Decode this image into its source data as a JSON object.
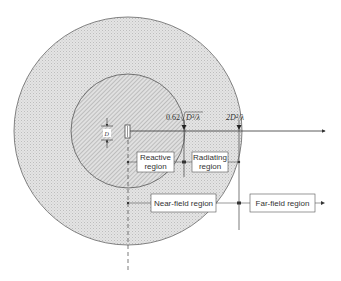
{
  "diagram": {
    "labels": {
      "reactive_line1": "Reactive",
      "reactive_line2": "region",
      "radiating_line1": "Radiating",
      "radiating_line2": "region",
      "near_field": "Near-field region",
      "far_field": "Far-field region",
      "dimension_d": "D",
      "formula_reactive_prefix": "0.62",
      "formula_reactive_body": "D³/λ",
      "formula_farfield": "2D²/λ"
    },
    "colors": {
      "outer_fill": "#dcdcdc",
      "inner_fill": "#cfcfcf",
      "line": "#333333",
      "box_fill": "#ffffff"
    }
  }
}
